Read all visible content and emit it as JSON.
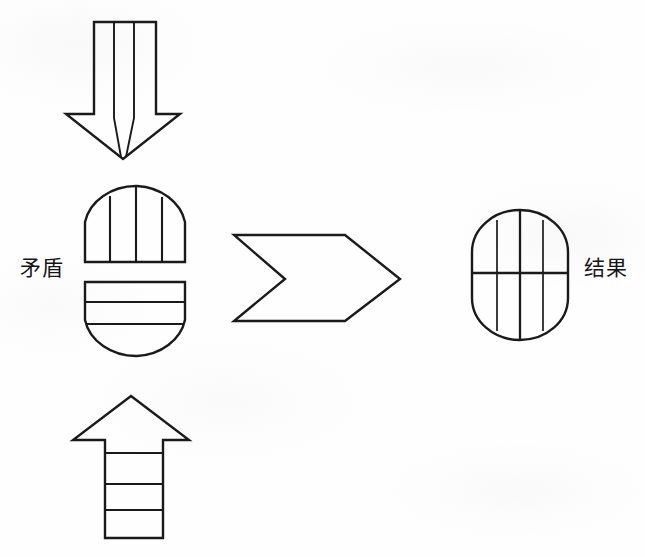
{
  "figure": {
    "width": 645,
    "height": 557,
    "background_color": "#fefefe",
    "ink_color": "#1a1a1a"
  },
  "labels": {
    "left": "矛盾",
    "right": "结果"
  },
  "shapes": {
    "down_arrow": {
      "name": "down-arrow",
      "description": "Hollow downward block arrow with two interior vertical dividing lines running the full length",
      "interior_line_count": 2,
      "interior_line_orientation": "vertical"
    },
    "top_dome": {
      "name": "contradiction-top-half",
      "description": "Upper half of a rounded rectangle (dome / arch) divided by three vertical lines",
      "interior_line_count": 3,
      "interior_line_orientation": "vertical"
    },
    "bottom_dome": {
      "name": "contradiction-bottom-half",
      "description": "Lower half of a rounded rectangle (inverted dome) divided by two horizontal lines",
      "interior_line_count": 2,
      "interior_line_orientation": "horizontal"
    },
    "chevron": {
      "name": "chevron-arrow",
      "description": "Hollow right-pointing chevron / banner arrow with notched tail",
      "direction": "right"
    },
    "result_shape": {
      "name": "result-rounded-rectangle",
      "description": "Complete rounded rectangle combining both halves: three vertical lines and one horizontal line",
      "vertical_line_count": 3,
      "horizontal_line_count": 1
    },
    "up_arrow": {
      "name": "up-arrow",
      "description": "Hollow upward block arrow with narrow shaft divided by three horizontal lines",
      "interior_line_count": 3,
      "interior_line_orientation": "horizontal"
    }
  }
}
